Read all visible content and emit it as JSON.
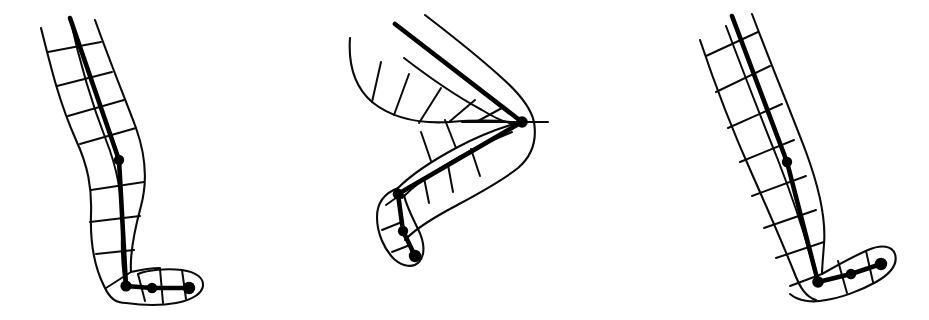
{
  "figure": {
    "background_color": "#ffffff",
    "ink_color": "#000000",
    "canvas": {
      "width": 929,
      "height": 320
    },
    "stroke_widths": {
      "outline": 2.1,
      "mesh_rib": 2.0,
      "skeleton_bone": 4.6
    },
    "panels": [
      {
        "name": "pose-left",
        "label": "Pose A — near-straight standing leg, foot forward",
        "index": 1,
        "joints": [
          {
            "name": "knee",
            "x": 119,
            "y": 160,
            "r": 5.2
          },
          {
            "name": "ankle",
            "x": 126,
            "y": 286,
            "r": 5.6
          },
          {
            "name": "midfoot",
            "x": 152,
            "y": 288,
            "r": 5.2
          },
          {
            "name": "toe-tip",
            "x": 189,
            "y": 288,
            "r": 6.2
          }
        ],
        "bone_chain": [
          {
            "x": 70,
            "y": 18
          },
          {
            "x": 119,
            "y": 160
          },
          {
            "x": 126,
            "y": 286
          },
          {
            "x": 152,
            "y": 288
          },
          {
            "x": 189,
            "y": 288
          }
        ],
        "front_outline": "M 41,28 C 52,72 60,104 76,140 C 88,166 92,188 91,214 C 90,244 95,268 104,286 C 110,299 116,303 126,303",
        "back_outline": "M 95,20 C 110,62 124,96 136,128 C 146,156 148,180 141,206 C 134,232 130,258 131,272",
        "shank_front": "M 126,303 C 140,305 160,306 176,303 C 193,300 202,293 203,286 C 204,278 196,272 182,270 C 166,268 148,270 138,274",
        "shank_back": "M 131,272 C 140,270 150,268 160,268",
        "mesh_ribs": [
          "M 48,52 L 101,42",
          "M 57,86 L 112,72",
          "M 68,116 L 124,100",
          "M 80,144 L 136,128",
          "M 91,190 L 144,182",
          "M 90,222 L 140,216",
          "M 96,254 L 134,250",
          "M 106,288 L 131,272",
          "M 136,274 L 143,300",
          "M 160,270 L 163,302",
          "M 182,270 L 186,300"
        ],
        "mesh_long_rails": [
          "M 70,18 C 80,64 92,104 106,140 C 118,170 123,200 122,232 C 121,262 124,280 126,290"
        ]
      },
      {
        "name": "pose-middle",
        "label": "Pose B — deeply flexed S-shaped leg, foot pointed down",
        "index": 2,
        "joints": [
          {
            "name": "knee",
            "x": 522,
            "y": 122,
            "r": 5.8
          },
          {
            "name": "ankle",
            "x": 398,
            "y": 194,
            "r": 5.4
          },
          {
            "name": "midfoot",
            "x": 403,
            "y": 231,
            "r": 5.2
          },
          {
            "name": "toe-tip",
            "x": 415,
            "y": 256,
            "r": 6.2
          }
        ],
        "bone_chain": [
          {
            "x": 395,
            "y": 24
          },
          {
            "x": 522,
            "y": 122
          },
          {
            "x": 398,
            "y": 194
          },
          {
            "x": 403,
            "y": 231
          },
          {
            "x": 415,
            "y": 256
          }
        ],
        "upper_outline": "M 350,38 C 348,66 356,88 372,102 C 392,118 420,124 450,122 C 476,120 500,120 517,123",
        "upper_outline_back": "M 425,15 C 455,38 480,58 502,78 C 520,94 531,108 534,122 C 537,140 532,156 518,168 C 498,184 470,198 448,210",
        "lower_outline_front": "M 517,123 C 500,128 478,136 456,148 C 430,162 410,176 398,188",
        "lower_outline_back": "M 448,210 C 428,220 412,230 404,240",
        "foot_outline": "M 398,188 C 386,192 378,202 378,216 C 378,232 384,248 394,258 C 402,266 412,268 418,262 C 425,255 424,242 418,230 C 412,218 406,206 404,196",
        "mesh_ribs": [
          "M 372,102 L 381,62",
          "M 393,114 L 408,74",
          "M 418,123 L 440,88",
          "M 448,123 L 474,100",
          "M 476,122 L 500,108",
          "M 456,148 L 444,120",
          "M 430,162 L 420,132",
          "M 470,150 L 478,176",
          "M 448,166 L 452,192",
          "M 424,178 L 428,202",
          "M 404,190 L 392,206",
          "M 400,218 L 386,228",
          "M 408,244 L 394,250"
        ],
        "mesh_long_rails": [
          "M 404,58 C 430,78 456,96 482,110 C 498,120 510,124 518,125",
          "M 512,132 C 492,140 466,152 444,166 C 424,178 410,190 402,198"
        ]
      },
      {
        "name": "pose-right",
        "label": "Pose C — tilted near-straight leg, foot forward-right",
        "index": 3,
        "joints": [
          {
            "name": "knee",
            "x": 787,
            "y": 162,
            "r": 5.2
          },
          {
            "name": "ankle",
            "x": 818,
            "y": 282,
            "r": 5.8
          },
          {
            "name": "midfoot",
            "x": 851,
            "y": 274,
            "r": 5.2
          },
          {
            "name": "toe-tip",
            "x": 881,
            "y": 264,
            "r": 6.2
          }
        ],
        "bone_chain": [
          {
            "x": 732,
            "y": 16
          },
          {
            "x": 787,
            "y": 162
          },
          {
            "x": 818,
            "y": 282
          },
          {
            "x": 851,
            "y": 274
          },
          {
            "x": 881,
            "y": 264
          }
        ],
        "front_outline": "M 700,40 C 716,88 734,134 752,174 C 768,210 782,242 794,272 C 800,288 806,297 816,300",
        "back_outline": "M 752,14 C 770,62 790,110 806,152 C 820,190 826,220 824,244 C 823,258 822,268 822,274",
        "foot_top": "M 822,274 C 836,266 854,256 868,250 C 882,244 892,246 895,254 C 898,264 890,274 876,282 C 860,291 840,298 826,300",
        "foot_bottom": "M 816,300 C 800,303 790,300 786,293",
        "mesh_ribs": [
          "M 706,56 L 758,32",
          "M 716,92 L 770,66",
          "M 728,128 L 782,104",
          "M 740,162 L 794,140",
          "M 752,196 L 806,176",
          "M 764,228 L 816,210",
          "M 776,258 L 824,242",
          "M 790,286 L 822,274",
          "M 838,262 L 846,292",
          "M 866,252 L 872,282"
        ],
        "mesh_long_rails": [
          "M 726,26 C 744,74 762,120 778,160 C 792,196 804,232 812,262 C 816,276 818,282 820,286"
        ]
      }
    ]
  }
}
